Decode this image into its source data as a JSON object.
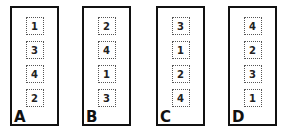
{
  "panels": [
    {
      "label": "A",
      "cards": [
        "1",
        "3",
        "4",
        "2"
      ]
    },
    {
      "label": "B",
      "cards": [
        "2",
        "4",
        "1",
        "3"
      ]
    },
    {
      "label": "C",
      "cards": [
        "3",
        "1",
        "2",
        "4"
      ]
    },
    {
      "label": "D",
      "cards": [
        "4",
        "2",
        "3",
        "1"
      ]
    }
  ]
}
